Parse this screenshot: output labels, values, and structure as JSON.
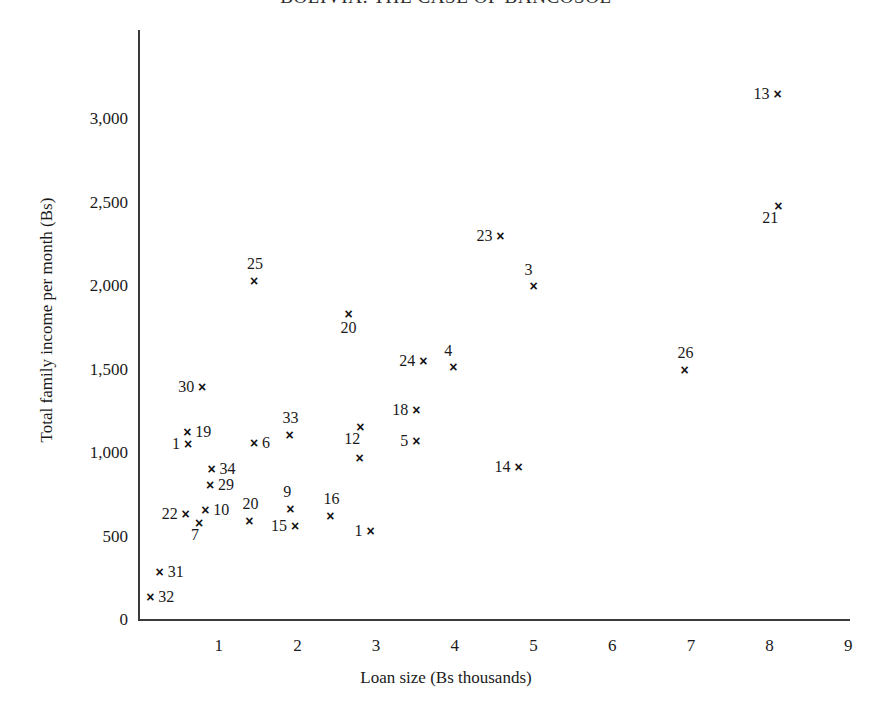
{
  "chart_data": {
    "type": "scatter",
    "title": "BOLIVIA: THE CASE OF BANCOSOL",
    "xlabel": "Loan size (Bs thousands)",
    "ylabel": "Total family income per month (Bs)",
    "xlim": [
      0,
      9
    ],
    "ylim": [
      0,
      3400
    ],
    "grid": false,
    "legend": "none",
    "xticks": [
      "1",
      "2",
      "3",
      "4",
      "5",
      "6",
      "7",
      "8",
      "9"
    ],
    "xtick_values": [
      1,
      2,
      3,
      4,
      5,
      6,
      7,
      8,
      9
    ],
    "yticks": [
      "0",
      "500",
      "1,000",
      "1,500",
      "2,000",
      "2,500",
      "3,000"
    ],
    "ytick_values": [
      0,
      500,
      1000,
      1500,
      2000,
      2500,
      3000
    ],
    "points": [
      {
        "label": "13",
        "x": 8.1,
        "y": 3150,
        "label_pos": "left"
      },
      {
        "label": "21",
        "x": 8.11,
        "y": 2480,
        "label_pos": "below-left"
      },
      {
        "label": "23",
        "x": 4.58,
        "y": 2300,
        "label_pos": "left"
      },
      {
        "label": "3",
        "x": 5.0,
        "y": 2000,
        "label_pos": "above-left"
      },
      {
        "label": "25",
        "x": 1.45,
        "y": 2030,
        "label_pos": "above"
      },
      {
        "label": "20",
        "x": 2.65,
        "y": 1830,
        "label_pos": "below"
      },
      {
        "label": "24",
        "x": 3.6,
        "y": 1550,
        "label_pos": "left"
      },
      {
        "label": "4",
        "x": 3.98,
        "y": 1515,
        "label_pos": "above-left"
      },
      {
        "label": "26",
        "x": 6.92,
        "y": 1500,
        "label_pos": "above"
      },
      {
        "label": "30",
        "x": 0.79,
        "y": 1395,
        "label_pos": "left"
      },
      {
        "label": "18",
        "x": 3.51,
        "y": 1260,
        "label_pos": "left"
      },
      {
        "label": "12",
        "x": 2.8,
        "y": 1155,
        "label_pos": "below-left"
      },
      {
        "label": "33",
        "x": 1.9,
        "y": 1105,
        "label_pos": "above"
      },
      {
        "label": "19",
        "x": 0.6,
        "y": 1125,
        "label_pos": "right"
      },
      {
        "label": "6",
        "x": 1.45,
        "y": 1060,
        "label_pos": "right"
      },
      {
        "label": "5",
        "x": 3.51,
        "y": 1070,
        "label_pos": "left"
      },
      {
        "label": "1",
        "x": 0.61,
        "y": 1055,
        "label_pos": "left"
      },
      {
        "label": "",
        "x": 2.79,
        "y": 970,
        "label_pos": "none"
      },
      {
        "label": "14",
        "x": 4.81,
        "y": 915,
        "label_pos": "left"
      },
      {
        "label": "34",
        "x": 0.91,
        "y": 905,
        "label_pos": "right"
      },
      {
        "label": "29",
        "x": 0.89,
        "y": 810,
        "label_pos": "right"
      },
      {
        "label": "9",
        "x": 1.91,
        "y": 665,
        "label_pos": "above"
      },
      {
        "label": "10",
        "x": 0.83,
        "y": 660,
        "label_pos": "right"
      },
      {
        "label": "22",
        "x": 0.58,
        "y": 635,
        "label_pos": "left"
      },
      {
        "label": "16",
        "x": 2.42,
        "y": 625,
        "label_pos": "above"
      },
      {
        "label": "20",
        "x": 1.39,
        "y": 595,
        "label_pos": "above"
      },
      {
        "label": "7",
        "x": 0.75,
        "y": 580,
        "label_pos": "below-left"
      },
      {
        "label": "15",
        "x": 1.97,
        "y": 560,
        "label_pos": "left"
      },
      {
        "label": "1",
        "x": 2.93,
        "y": 530,
        "label_pos": "left"
      },
      {
        "label": "31",
        "x": 0.25,
        "y": 285,
        "label_pos": "right"
      },
      {
        "label": "32",
        "x": 0.13,
        "y": 140,
        "label_pos": "right"
      }
    ],
    "marker_glyph": "×"
  }
}
